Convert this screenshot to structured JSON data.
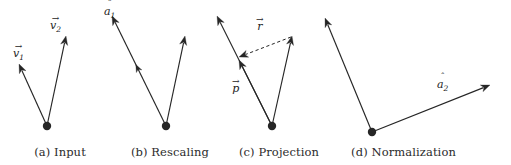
{
  "figure": {
    "width": 511,
    "height": 165,
    "background": "#ffffff",
    "ink_color": "#262626",
    "caption_color": "#2b2b2b"
  },
  "panels": [
    {
      "id": "input",
      "caption": "(a) Input",
      "origin": {
        "x": 47,
        "y": 126
      },
      "vectors": [
        {
          "name": "v1",
          "label_accent": "→",
          "label_base": "v",
          "label_sub": "1",
          "label_x": 13,
          "label_y": 44,
          "from": {
            "x": 47,
            "y": 126
          },
          "to": {
            "x": 19,
            "y": 64
          },
          "style": "solid",
          "arrowheads": 1
        },
        {
          "name": "v2",
          "label_accent": "→",
          "label_base": "v",
          "label_sub": "2",
          "label_x": 50,
          "label_y": 16,
          "from": {
            "x": 47,
            "y": 126
          },
          "to": {
            "x": 66,
            "y": 36
          },
          "style": "solid",
          "arrowheads": 1
        }
      ]
    },
    {
      "id": "rescaling",
      "caption": "(b) Rescaling",
      "origin": {
        "x": 166,
        "y": 126
      },
      "vectors": [
        {
          "name": "a1-hat",
          "label_accent": "ˆ",
          "label_base": "a",
          "label_sub": "1",
          "label_x": 104,
          "label_y": 2,
          "from": {
            "x": 166,
            "y": 126
          },
          "to": {
            "x": 112,
            "y": 16
          },
          "style": "solid",
          "arrowheads": 2,
          "inner_head_t": 0.56
        },
        {
          "name": "v2",
          "label_accent": "",
          "label_base": "",
          "label_sub": "",
          "label_x": 0,
          "label_y": 0,
          "from": {
            "x": 166,
            "y": 126
          },
          "to": {
            "x": 185,
            "y": 36
          },
          "style": "solid",
          "arrowheads": 1
        }
      ]
    },
    {
      "id": "projection",
      "caption": "(c) Projection",
      "origin": {
        "x": 272,
        "y": 126
      },
      "vectors": [
        {
          "name": "a1-hat-long",
          "label_accent": "",
          "label_base": "",
          "label_sub": "",
          "label_x": 0,
          "label_y": 0,
          "from": {
            "x": 272,
            "y": 126
          },
          "to": {
            "x": 217,
            "y": 16
          },
          "style": "solid",
          "arrowheads": 1
        },
        {
          "name": "p",
          "label_accent": "→",
          "label_base": "p",
          "label_sub": "",
          "label_x": 232,
          "label_y": 79,
          "from": {
            "x": 272,
            "y": 126
          },
          "to": {
            "x": 239,
            "y": 60
          },
          "style": "solid",
          "arrowheads": 1
        },
        {
          "name": "v2",
          "label_accent": "",
          "label_base": "",
          "label_sub": "",
          "label_x": 0,
          "label_y": 0,
          "from": {
            "x": 272,
            "y": 126
          },
          "to": {
            "x": 292,
            "y": 36
          },
          "style": "solid",
          "arrowheads": 1
        },
        {
          "name": "r",
          "label_accent": "→",
          "label_base": "r",
          "label_sub": "",
          "label_x": 256,
          "label_y": 17,
          "from": {
            "x": 291,
            "y": 37
          },
          "to": {
            "x": 239,
            "y": 57
          },
          "style": "dashed",
          "arrowheads": 1
        }
      ]
    },
    {
      "id": "normalization",
      "caption": "(d) Normalization",
      "origin": {
        "x": 372,
        "y": 132
      },
      "vectors": [
        {
          "name": "a1-hat",
          "label_accent": "",
          "label_base": "",
          "label_sub": "",
          "label_x": 0,
          "label_y": 0,
          "from": {
            "x": 372,
            "y": 132
          },
          "to": {
            "x": 325,
            "y": 18
          },
          "style": "solid",
          "arrowheads": 1
        },
        {
          "name": "a2-hat",
          "label_accent": "ˆ",
          "label_base": "a",
          "label_sub": "2",
          "label_x": 437,
          "label_y": 75,
          "from": {
            "x": 372,
            "y": 132
          },
          "to": {
            "x": 490,
            "y": 85
          },
          "style": "solid",
          "arrowheads": 1
        }
      ]
    }
  ],
  "captions": {
    "a": "(a) Input",
    "b": "(b) Rescaling",
    "c": "(c) Projection",
    "d": "(d) Normalization"
  }
}
